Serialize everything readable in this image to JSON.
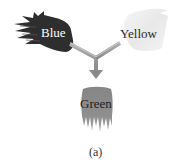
{
  "diagram": {
    "inputs": [
      {
        "label": "Blue",
        "fill": "#2e2e2e",
        "text_color": "#ffffff"
      },
      {
        "label": "Yellow",
        "fill": "#ececec",
        "text_color": "#2a2a2a"
      }
    ],
    "output": {
      "label": "Green",
      "fill": "#8c8c8c",
      "text_color": "#1f1f1f"
    },
    "arrow_color": "#9a9a9a",
    "caption": "(a)"
  }
}
